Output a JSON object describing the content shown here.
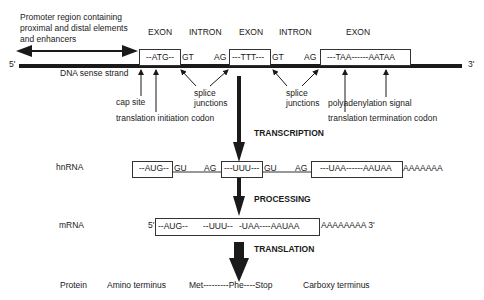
{
  "promoter": {
    "label_line1": "Promoter region containing",
    "label_line2": "proximal and distal elements",
    "label_line3": "and enhancers"
  },
  "dna": {
    "five_prime": "5'",
    "three_prime": "3'",
    "strand_label": "DNA sense strand",
    "regions": [
      "EXON",
      "INTRON",
      "EXON",
      "INTRON",
      "EXON"
    ],
    "exon1": "--ATG--",
    "exon2": "---TTT---",
    "exon3": "---TAA------AATAA",
    "gt1": "GT",
    "ag1": "AG",
    "gt2": "GT",
    "ag2": "AG"
  },
  "annotations": {
    "cap_site": "cap site",
    "translation_initiation": "translation initiation codon",
    "splice1_line1": "splice",
    "splice1_line2": "junctions",
    "splice2_line1": "splice",
    "splice2_line2": "junctions",
    "translation_termination": "translation termination codon",
    "polyadenylation": "polyadenylation signal"
  },
  "steps": {
    "transcription": "TRANSCRIPTION",
    "processing": "PROCESSING",
    "translation": "TRANSLATION"
  },
  "hnrna": {
    "label": "hnRNA",
    "exon1": "--AUG--",
    "gu1": "GU",
    "ag1": "AG",
    "exon2": "---UUU---",
    "gu2": "GU",
    "ag2": "AG",
    "exon3": "---UAA------AAUAA",
    "polya": "AAAAAAA"
  },
  "mrna": {
    "label": "mRNA",
    "five_prime": "5'",
    "seg1": "--AUG--",
    "seg2": "--UUU--",
    "seg3": "-UAA----AAUAA",
    "polya": "AAAAAAAA 3'"
  },
  "protein": {
    "label": "Protein",
    "amino": "Amino terminus",
    "sequence": "Met---------Phe----Stop",
    "carboxy": "Carboxy terminus"
  }
}
